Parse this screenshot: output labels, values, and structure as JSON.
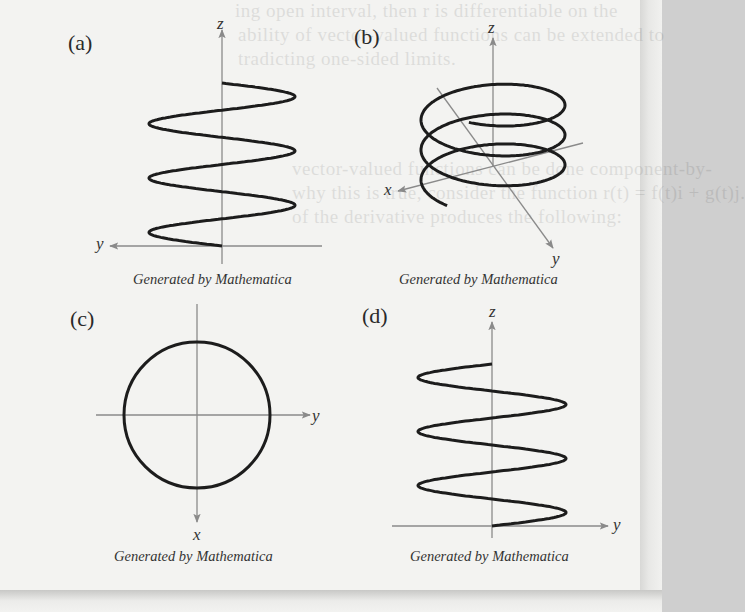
{
  "figure": {
    "panels": [
      {
        "id": "a",
        "label": "(a)",
        "caption": "Generated by Mathematica",
        "axes": {
          "vertical": "z",
          "horizontal": "y"
        },
        "curve": {
          "type": "sinusoid-vertical",
          "periods": 3,
          "description": "side view of helix projected onto yz-plane"
        }
      },
      {
        "id": "b",
        "label": "(b)",
        "caption": "Generated by Mathematica",
        "axes": {
          "vertical": "z",
          "left": "x",
          "diagonal": "y"
        },
        "curve": {
          "type": "helix",
          "turns": 3,
          "description": "3D helix around z-axis"
        }
      },
      {
        "id": "c",
        "label": "(c)",
        "caption": "Generated by Mathematica",
        "axes": {
          "horizontal": "y",
          "vertical": "x"
        },
        "curve": {
          "type": "circle",
          "description": "top view of helix projected onto xy-plane"
        }
      },
      {
        "id": "d",
        "label": "(d)",
        "caption": "Generated by Mathematica",
        "axes": {
          "vertical": "z",
          "horizontal": "y"
        },
        "curve": {
          "type": "sinusoid-vertical",
          "periods": 3,
          "description": "side view of helix projected onto yz-plane (mirrored phase)"
        }
      }
    ],
    "colors": {
      "curve": "#1c1c1c",
      "axis": "#8a8a8a",
      "page": "#f3f3f1",
      "text": "#333333"
    }
  },
  "bleed_through_text": [
    "ing open interval, then r is differentiable on the",
    "ability of vector-valued functions can be extended to",
    "tradicting one-sided limits.",
    "vector-valued functions can be done component-by-",
    "why this is true, consider the function r(t) = f(t)i + g(t)j.",
    "of the derivative produces the following:"
  ]
}
